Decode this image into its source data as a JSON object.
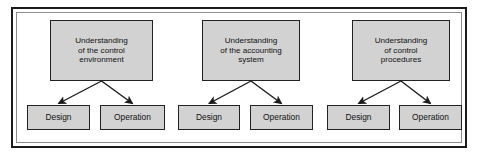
{
  "diagram": {
    "type": "hierarchy-flow",
    "frame": {
      "outer_border_color": "#1b1b1b",
      "inner_border_color": "#8c8c8c",
      "background": "#ffffff"
    },
    "node_style": {
      "fill": "#d2d2d2",
      "stroke": "#222222",
      "text_color": "#111111"
    },
    "arrow_color": "#1b1b1b",
    "groups": [
      {
        "id": "control-environment",
        "parent": {
          "label": "Understanding\nof the control\nenvironment",
          "x": 50,
          "y": 20,
          "w": 103,
          "h": 61
        },
        "children": [
          {
            "id": "design",
            "label": "Design",
            "x": 27,
            "y": 105,
            "w": 63,
            "h": 25
          },
          {
            "id": "operation",
            "label": "Operation",
            "x": 100,
            "y": 105,
            "w": 65,
            "h": 25
          }
        ]
      },
      {
        "id": "accounting-system",
        "parent": {
          "label": "Understanding\nof the accounting\nsystem",
          "x": 202,
          "y": 20,
          "w": 98,
          "h": 61
        },
        "children": [
          {
            "id": "design",
            "label": "Design",
            "x": 178,
            "y": 105,
            "w": 62,
            "h": 25
          },
          {
            "id": "operation",
            "label": "Operation",
            "x": 250,
            "y": 105,
            "w": 63,
            "h": 25
          }
        ]
      },
      {
        "id": "control-procedures",
        "parent": {
          "label": "Understanding\nof control\nprocedures",
          "x": 352,
          "y": 20,
          "w": 98,
          "h": 61
        },
        "children": [
          {
            "id": "design",
            "label": "Design",
            "x": 327,
            "y": 105,
            "w": 63,
            "h": 25
          },
          {
            "id": "operation",
            "label": "Operation",
            "x": 399,
            "y": 105,
            "w": 63,
            "h": 25
          }
        ]
      }
    ]
  }
}
